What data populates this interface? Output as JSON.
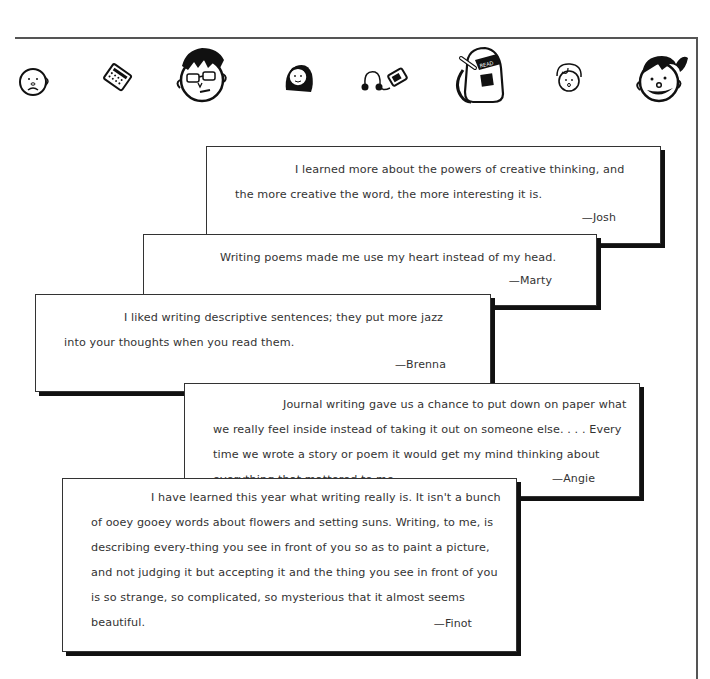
{
  "header": {
    "icons": [
      {
        "name": "bald-kid-face-icon"
      },
      {
        "name": "calculator-icon"
      },
      {
        "name": "boy-with-glasses-face-icon"
      },
      {
        "name": "girl-long-hair-face-icon"
      },
      {
        "name": "headphones-music-player-icon"
      },
      {
        "name": "backpack-read-icon",
        "label": "READ"
      },
      {
        "name": "small-kid-face-icon"
      },
      {
        "name": "smiling-girl-ponytail-face-icon"
      }
    ]
  },
  "quotes": [
    {
      "text": "I learned more about the powers of creative thinking, and the more creative the word, the more interesting it is.",
      "author": "—Josh"
    },
    {
      "text": "Writing poems made me use my heart instead of my head.",
      "author": "—Marty"
    },
    {
      "text": "I liked writing descriptive sentences; they put more jazz into your thoughts when you read them.",
      "author": "—Brenna"
    },
    {
      "text": "Journal writing gave us a chance to put down on paper what we really feel inside instead of taking it out on someone else. . . . Every time we wrote a story or poem it would get my mind thinking about everything that mattered to me.",
      "author": "—Angie"
    },
    {
      "text": "I have learned this year what writing really is. It isn't a bunch of ooey gooey words about flowers and setting suns. Writing, to me, is describing every-thing you see in front of you so as to paint a picture, and not judging it but accepting it and the thing you see in front of you is so strange, so complicated, so mysterious that it almost seems beautiful.",
      "author": "—Finot"
    }
  ]
}
